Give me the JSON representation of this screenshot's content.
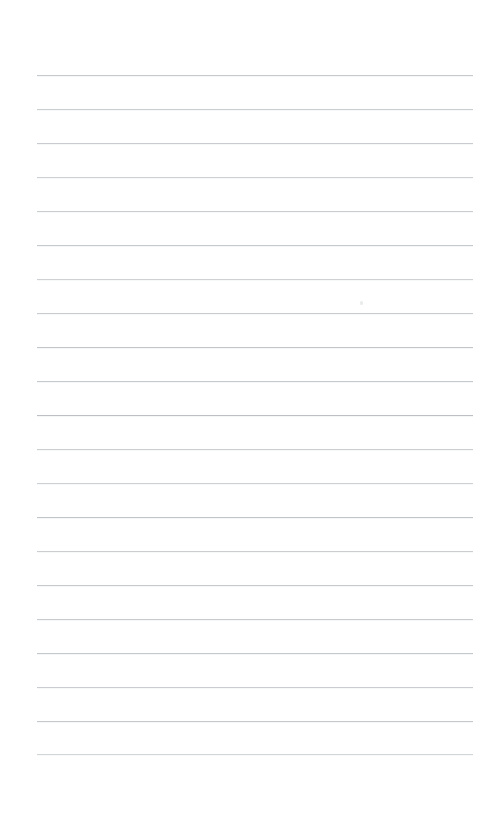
{
  "page": {
    "name": "ruled-notepaper",
    "kind": "blank lined paper sheet",
    "width_px": 491,
    "height_px": 827,
    "background_color": "#ffffff",
    "has_text_content": false,
    "written_content": "",
    "top_margin_px": 75,
    "bottom_margin_px": 73
  },
  "ruling": {
    "line_color": "#b9bdc2",
    "line_thickness_px": 1,
    "line_count": 21,
    "line_left_px": 37,
    "line_right_px": 473,
    "line_width_px": 436,
    "line_spacing_px": 33.95,
    "first_line_y_px": 75,
    "last_line_y_px": 754,
    "lines": [
      {
        "index": 1,
        "y": 75,
        "opacity": 0.8
      },
      {
        "index": 2,
        "y": 109,
        "opacity": 0.72
      },
      {
        "index": 3,
        "y": 143,
        "opacity": 0.78
      },
      {
        "index": 4,
        "y": 177,
        "opacity": 0.7
      },
      {
        "index": 5,
        "y": 211,
        "opacity": 0.74
      },
      {
        "index": 6,
        "y": 245,
        "opacity": 0.82
      },
      {
        "index": 7,
        "y": 279,
        "opacity": 0.68
      },
      {
        "index": 8,
        "y": 313,
        "opacity": 0.76
      },
      {
        "index": 9,
        "y": 347,
        "opacity": 0.86
      },
      {
        "index": 10,
        "y": 381,
        "opacity": 0.8
      },
      {
        "index": 11,
        "y": 415,
        "opacity": 0.95
      },
      {
        "index": 12,
        "y": 449,
        "opacity": 0.72
      },
      {
        "index": 13,
        "y": 483,
        "opacity": 0.7
      },
      {
        "index": 14,
        "y": 517,
        "opacity": 0.88
      },
      {
        "index": 15,
        "y": 551,
        "opacity": 0.74
      },
      {
        "index": 16,
        "y": 585,
        "opacity": 0.8
      },
      {
        "index": 17,
        "y": 619,
        "opacity": 0.78
      },
      {
        "index": 18,
        "y": 653,
        "opacity": 0.84
      },
      {
        "index": 19,
        "y": 687,
        "opacity": 0.76
      },
      {
        "index": 20,
        "y": 721,
        "opacity": 0.82
      },
      {
        "index": 21,
        "y": 754,
        "opacity": 0.62
      }
    ]
  },
  "marks": [
    {
      "name": "stray-speck",
      "x": 360,
      "y": 301,
      "opacity": 0.55
    }
  ]
}
